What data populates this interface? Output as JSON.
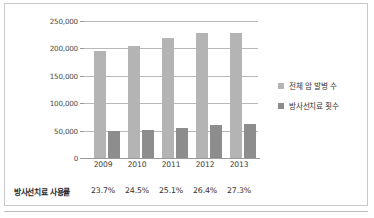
{
  "chart_data": {
    "type": "bar",
    "title": "",
    "xlabel": "",
    "ylabel": "",
    "categories": [
      "2009",
      "2010",
      "2011",
      "2012",
      "2013"
    ],
    "series": [
      {
        "name": "전체 암 발병 수",
        "values": [
          196000,
          205000,
          219000,
          228000,
          228000
        ],
        "color": "#b4b4b4"
      },
      {
        "name": "방사선치료 횟수",
        "values": [
          50000,
          51000,
          54000,
          61000,
          62000
        ],
        "color": "#8d8d8d"
      }
    ],
    "ylim": [
      0,
      250000
    ],
    "yticks": [
      0,
      50000,
      100000,
      150000,
      200000,
      250000
    ],
    "ytick_labels": [
      "0",
      "50,000",
      "100,000",
      "150,000",
      "200,000",
      "250,000"
    ],
    "grid": true,
    "legend_position": "right",
    "annotation_row": {
      "label": "방사선치료 사용률",
      "values": [
        "23.7%",
        "24.5%",
        "25.1%",
        "26.4%",
        "27.3%"
      ]
    }
  },
  "legend": {
    "items": [
      {
        "label": "전체 암 발병 수"
      },
      {
        "label": "방사선치료 횟수"
      }
    ]
  }
}
